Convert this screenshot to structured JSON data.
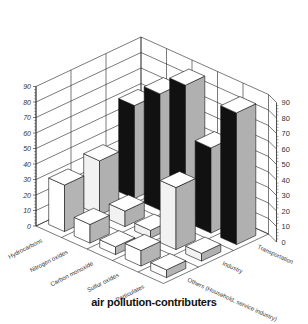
{
  "chart_data": {
    "type": "bar",
    "subtype": "3d-grouped-bar",
    "title": "air pollution-contributers",
    "categories": [
      "Hydrocarbons",
      "Nitrogen oxides",
      "Carbon monoxide",
      "Sulfur oxides",
      "Particulates"
    ],
    "series": [
      {
        "name": "Transportation",
        "values": [
          60,
          75,
          88,
          55,
          85
        ]
      },
      {
        "name": "Industry",
        "values": [
          35,
          10,
          5,
          40,
          5
        ]
      },
      {
        "name": "Others (Household, service industry)",
        "values": [
          30,
          12,
          5,
          10,
          5
        ]
      }
    ],
    "zlabel_ticks": [
      0,
      10,
      20,
      30,
      40,
      50,
      60,
      70,
      80,
      90
    ],
    "ylim": [
      0,
      90
    ],
    "grid": true,
    "legend": "none (series labeled along depth axis)"
  },
  "title": "air pollution-contributers"
}
